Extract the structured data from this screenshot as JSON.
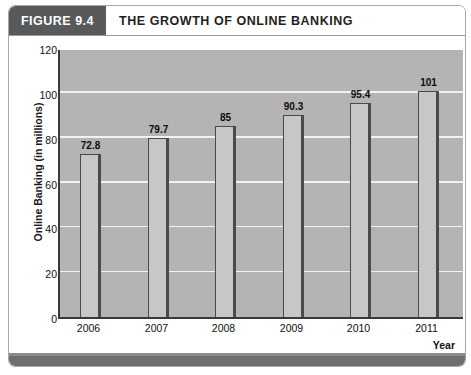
{
  "figure": {
    "badge_label": "FIGURE 9.4",
    "title": "THE GROWTH OF ONLINE BANKING"
  },
  "colors": {
    "badge_background": "#58595b",
    "plot_background": "#b4b4b4",
    "bar_fill": "#c7c7c7",
    "bar_border": "#4a4a4a",
    "gridline": "#f2f2f2",
    "axis": "#3a3a3a",
    "footer": "#6d6e70"
  },
  "chart_data": {
    "type": "bar",
    "title": "THE GROWTH OF ONLINE BANKING",
    "categories": [
      "2006",
      "2007",
      "2008",
      "2009",
      "2010",
      "2011"
    ],
    "values": [
      72.8,
      79.7,
      85,
      90.3,
      95.4,
      101
    ],
    "value_labels": [
      "72.8",
      "79.7",
      "85",
      "90.3",
      "95.4",
      "101"
    ],
    "xlabel": "Year",
    "ylabel": "Online Banking (in millions)",
    "ylim": [
      0,
      120
    ],
    "ytick_labels": [
      "0",
      "20",
      "40",
      "60",
      "80",
      "100",
      "120"
    ],
    "ytick_values": [
      0,
      20,
      40,
      60,
      80,
      100,
      120
    ],
    "grid": "horizontal",
    "legend": "none"
  }
}
